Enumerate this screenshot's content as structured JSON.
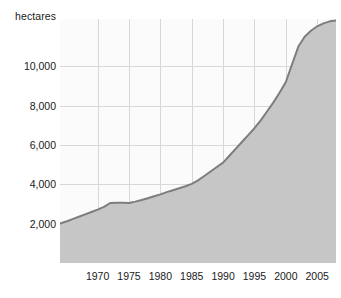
{
  "chart_data": {
    "type": "area",
    "title": "",
    "subtitle": "",
    "xlabel": "",
    "ylabel": "hectares",
    "unit_caption": "hectares",
    "grid": true,
    "legend": "none",
    "xlim": [
      1964,
      2008
    ],
    "ylim": [
      0,
      12400
    ],
    "xticks": [
      1970,
      1975,
      1980,
      1985,
      1990,
      1995,
      2000,
      2005
    ],
    "xtick_labels": [
      "1970",
      "1975",
      "1980",
      "1985",
      "1990",
      "1995",
      "2000",
      "2005"
    ],
    "yticks": [
      2000,
      4000,
      6000,
      8000,
      10000
    ],
    "ytick_labels": [
      "2,000",
      "4,000",
      "6,000",
      "8,000",
      "10,000"
    ],
    "series": [
      {
        "name": "hectares",
        "fill_color": "#c6c6c6",
        "line_color": "#7d7d7d",
        "x": [
          1964,
          1965,
          1966,
          1967,
          1968,
          1969,
          1970,
          1971,
          1972,
          1973,
          1974,
          1975,
          1976,
          1977,
          1978,
          1979,
          1980,
          1981,
          1982,
          1983,
          1984,
          1985,
          1986,
          1987,
          1988,
          1989,
          1990,
          1991,
          1992,
          1993,
          1994,
          1995,
          1996,
          1997,
          1998,
          1999,
          2000,
          2001,
          2002,
          2003,
          2004,
          2005,
          2006,
          2007,
          2008
        ],
        "values": [
          2000,
          2110,
          2230,
          2350,
          2470,
          2590,
          2710,
          2850,
          3050,
          3060,
          3060,
          3050,
          3120,
          3200,
          3290,
          3390,
          3490,
          3600,
          3700,
          3800,
          3900,
          4020,
          4200,
          4420,
          4650,
          4880,
          5100,
          5450,
          5800,
          6150,
          6500,
          6850,
          7250,
          7700,
          8150,
          8650,
          9200,
          10100,
          11000,
          11500,
          11800,
          12030,
          12180,
          12280,
          12330
        ]
      }
    ]
  },
  "axis": {
    "y_caption": "hectares"
  }
}
